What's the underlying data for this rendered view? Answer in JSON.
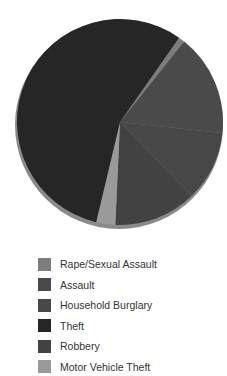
{
  "chart_data": {
    "type": "pie",
    "title": "",
    "legend_position": "bottom",
    "start_angle_deg": 35,
    "direction": "clockwise",
    "slices": [
      {
        "name": "Rape/Sexual Assault",
        "value": 1,
        "color": "#7d7d7d"
      },
      {
        "name": "Assault",
        "value": 16,
        "color": "#4a4a4a"
      },
      {
        "name": "Household Burglary",
        "value": 11,
        "color": "#474747"
      },
      {
        "name": "Robbery",
        "value": 13,
        "color": "#424242"
      },
      {
        "name": "Motor Vehicle Theft",
        "value": 3,
        "color": "#9a9a9a"
      },
      {
        "name": "Theft",
        "value": 56,
        "color": "#262626"
      }
    ]
  },
  "legend": {
    "items": [
      {
        "label": "Rape/Sexual Assault",
        "color": "#7d7d7d"
      },
      {
        "label": "Assault",
        "color": "#4a4a4a"
      },
      {
        "label": "Household Burglary",
        "color": "#474747"
      },
      {
        "label": "Theft",
        "color": "#262626"
      },
      {
        "label": "Robbery",
        "color": "#424242"
      },
      {
        "label": "Motor Vehicle Theft",
        "color": "#9a9a9a"
      }
    ]
  }
}
